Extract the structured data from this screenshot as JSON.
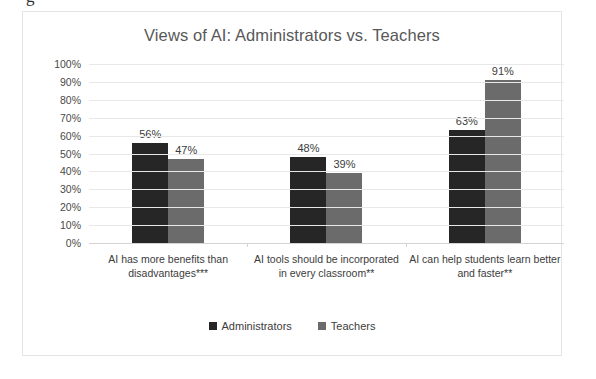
{
  "page_fragment": "g",
  "chart_data": {
    "type": "bar",
    "title": "Views of AI: Administrators vs. Teachers",
    "xlabel": "",
    "ylabel": "",
    "ylim": [
      0,
      100
    ],
    "ytick_labels": [
      "100%",
      "90%",
      "80%",
      "70%",
      "60%",
      "50%",
      "40%",
      "30%",
      "20%",
      "10%",
      "0%"
    ],
    "ytick_values": [
      100,
      90,
      80,
      70,
      60,
      50,
      40,
      30,
      20,
      10,
      0
    ],
    "grid": true,
    "legend_position": "bottom-center",
    "categories": [
      "AI has more benefits than disadvantages***",
      "AI tools should be incorporated in every classroom**",
      "AI can help students learn better and faster**"
    ],
    "series": [
      {
        "name": "Administrators",
        "color": "#262626",
        "values": [
          56,
          48,
          63
        ],
        "data_labels": [
          "56%",
          "48%",
          "63%"
        ]
      },
      {
        "name": "Teachers",
        "color": "#6b6b6b",
        "values": [
          47,
          39,
          91
        ],
        "data_labels": [
          "47%",
          "39%",
          "91%"
        ]
      }
    ]
  }
}
